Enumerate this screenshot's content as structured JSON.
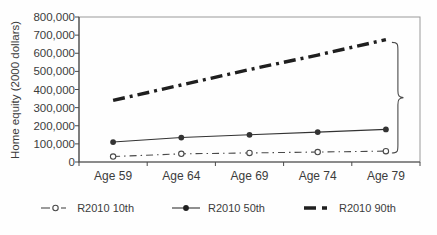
{
  "chart_data": {
    "type": "line",
    "title": "",
    "xlabel": "",
    "ylabel": "Home equity (2000 dollars)",
    "categories": [
      "Age 59",
      "Age 64",
      "Age 69",
      "Age 74",
      "Age 79"
    ],
    "ylim": [
      0,
      800000
    ],
    "y_tick_step": 100000,
    "y_tick_labels": [
      "800,000",
      "700,000",
      "600,000",
      "500,000",
      "400,000",
      "300,000",
      "200,000",
      "100,000",
      "0"
    ],
    "grid": false,
    "legend_position": "bottom",
    "series": [
      {
        "name": "R2010 10th",
        "values": [
          30000,
          45000,
          50000,
          55000,
          60000
        ],
        "line_style": "dash-dot-thin",
        "marker": "open-circle",
        "color": "#4a4a4a"
      },
      {
        "name": "R2010 50th",
        "values": [
          110000,
          135000,
          150000,
          165000,
          180000
        ],
        "line_style": "solid",
        "marker": "filled-circle",
        "color": "#333333"
      },
      {
        "name": "R2010 90th",
        "values": [
          340000,
          425000,
          510000,
          590000,
          675000
        ],
        "line_style": "dash-dot-thick",
        "marker": "none",
        "color": "#1f1f1f"
      }
    ],
    "annotations": [
      {
        "type": "right-curly-brace",
        "at_category": "Age 79",
        "y_from": 50000,
        "y_to": 660000
      }
    ],
    "colors": {
      "axis": "#4a4a4a",
      "border": "#8a8a8a",
      "text": "#3c3c3c",
      "background": "#fefefe"
    }
  }
}
